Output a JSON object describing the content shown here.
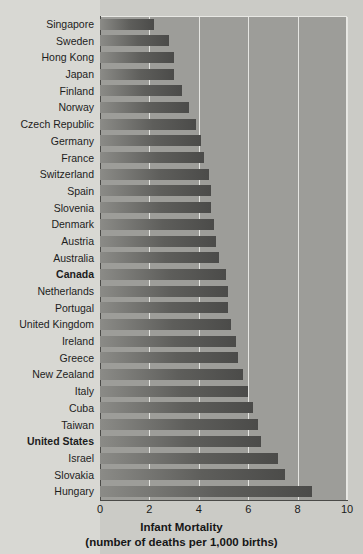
{
  "chart_data": {
    "type": "bar",
    "orientation": "horizontal",
    "title": "Infant Mortality",
    "subtitle": "(number of deaths per 1,000 births)",
    "xlabel": "Infant Mortality",
    "ylabel": "",
    "xlim": [
      0,
      10
    ],
    "xticks": [
      0,
      2,
      4,
      6,
      8,
      10
    ],
    "xtick_labels": [
      "0",
      "2",
      "4",
      "6",
      "8",
      "10"
    ],
    "grid": true,
    "grid_axis": "x",
    "legend": null,
    "categories": [
      "Singapore",
      "Sweden",
      "Hong Kong",
      "Japan",
      "Finland",
      "Norway",
      "Czech Republic",
      "Germany",
      "France",
      "Switzerland",
      "Spain",
      "Slovenia",
      "Denmark",
      "Austria",
      "Australia",
      "Canada",
      "Netherlands",
      "Portugal",
      "United Kingdom",
      "Ireland",
      "Greece",
      "New Zealand",
      "Italy",
      "Cuba",
      "Taiwan",
      "United States",
      "Israel",
      "Slovakia",
      "Hungary"
    ],
    "values": [
      2.2,
      2.8,
      3.0,
      3.0,
      3.3,
      3.6,
      3.9,
      4.1,
      4.2,
      4.4,
      4.5,
      4.5,
      4.6,
      4.7,
      4.8,
      5.1,
      5.2,
      5.2,
      5.3,
      5.5,
      5.6,
      5.8,
      6.0,
      6.2,
      6.4,
      6.5,
      7.2,
      7.5,
      8.6
    ],
    "highlighted": [
      "Canada",
      "United States"
    ],
    "bar_color_start": "#8b8b87",
    "bar_color_end": "#4b4b49",
    "plot_background": "#9d9d99",
    "label_background": "#d8d8d3",
    "gridline_color": "#e6e6e2",
    "axis_color": "#4a4a47"
  }
}
